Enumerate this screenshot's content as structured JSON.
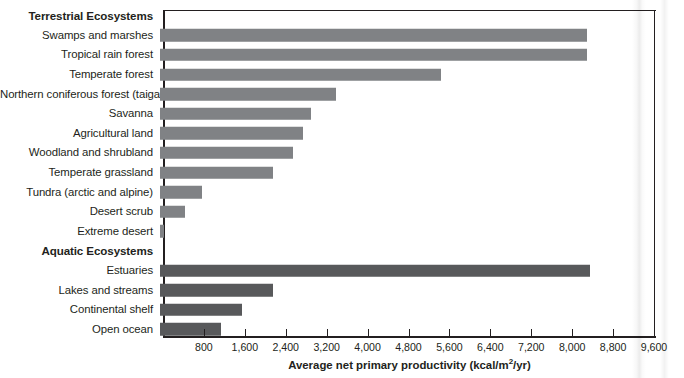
{
  "chart_data": {
    "type": "bar",
    "orientation": "horizontal",
    "title": "",
    "xlabel": "Average net primary productivity (kcal/m²/yr)",
    "ylabel": "",
    "xlim": [
      0,
      9600
    ],
    "xticks": [
      800,
      1600,
      2400,
      3200,
      4000,
      4800,
      5600,
      6400,
      7200,
      8000,
      8800,
      9600
    ],
    "xtick_labels": [
      "800",
      "1,600",
      "2,400",
      "3,200",
      "4,000",
      "4,800",
      "5,600",
      "6,400",
      "7,200",
      "8,000",
      "8,800",
      "9,600"
    ],
    "grid": false,
    "legend": "none",
    "groups": [
      {
        "name": "Terrestrial Ecosystems",
        "color": "#808285",
        "categories": [
          "Swamps and marshes",
          "Tropical rain forest",
          "Temperate forest",
          "Northern coniferous forest (taiga)",
          "Savanna",
          "Agricultural land",
          "Woodland and shrubland",
          "Temperate grassland",
          "Tundra (arctic and alpine)",
          "Desert scrub",
          "Extreme desert"
        ],
        "values": [
          8350,
          8350,
          5500,
          3450,
          2950,
          2800,
          2600,
          2200,
          820,
          490,
          70
        ]
      },
      {
        "name": "Aquatic Ecosystems",
        "color": "#58595b",
        "categories": [
          "Estuaries",
          "Lakes and streams",
          "Continental shelf",
          "Open ocean"
        ],
        "values": [
          8400,
          2200,
          1600,
          1200
        ]
      }
    ]
  },
  "colors": {
    "terrestrial_bar": "#808285",
    "aquatic_bar": "#58595b",
    "axis": "#231f20",
    "background": "#ffffff"
  }
}
